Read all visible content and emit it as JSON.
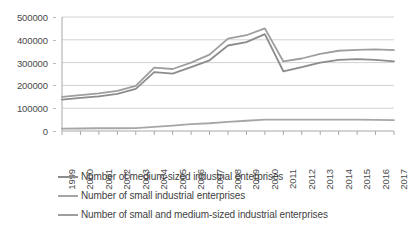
{
  "chart_data": {
    "type": "line",
    "title": "",
    "subtitle": "",
    "xlabel": "",
    "ylabel": "",
    "grid": "horizontal",
    "legend_position": "bottom-left",
    "ylim": [
      0,
      500000
    ],
    "ytick_step": 100000,
    "yticks": [
      "0",
      "100000",
      "200000",
      "300000",
      "400000",
      "500000"
    ],
    "ytick_values": [
      0,
      100000,
      200000,
      300000,
      400000,
      500000
    ],
    "categories": [
      "1999",
      "2000",
      "2001",
      "2002",
      "2003",
      "2004",
      "2005",
      "2006",
      "2007",
      "2008",
      "2009",
      "2010",
      "2011",
      "2012",
      "2013",
      "2014",
      "2015",
      "2016",
      "2017"
    ],
    "series": [
      {
        "name": "Number of medium-sized industrial enterprises",
        "color": "#8c8c8c",
        "values": [
          138000,
          145000,
          152000,
          163000,
          185000,
          258000,
          252000,
          280000,
          310000,
          375000,
          390000,
          425000,
          262000,
          280000,
          300000,
          312000,
          315000,
          312000,
          305000
        ]
      },
      {
        "name": "Number of small industrial enterprises",
        "color": "#a6a6a6",
        "values": [
          10000,
          11000,
          12000,
          12000,
          13000,
          18000,
          24000,
          30000,
          34000,
          40000,
          45000,
          50000,
          50000,
          50000,
          50000,
          50000,
          50000,
          49000,
          48000
        ]
      },
      {
        "name": "Number of small and medium-sized industrial enterprises",
        "color": "#9e9e9e",
        "values": [
          150000,
          157000,
          165000,
          176000,
          198000,
          278000,
          272000,
          300000,
          335000,
          405000,
          420000,
          450000,
          305000,
          318000,
          338000,
          352000,
          356000,
          358000,
          355000
        ]
      }
    ]
  },
  "legend": {
    "items": [
      {
        "label": "Number of medium-sized industrial enterprises"
      },
      {
        "label": "Number of small industrial enterprises"
      },
      {
        "label": "Number of small and medium-sized industrial enterprises"
      }
    ]
  }
}
